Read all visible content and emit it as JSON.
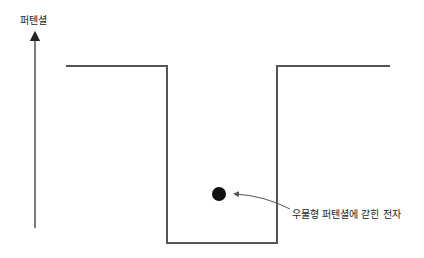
{
  "diagram": {
    "axis_label": "퍼텐셜",
    "annotation": "우물형 퍼텐셜에 갇힌 전자",
    "colors": {
      "line": "#555555",
      "particle": "#111111",
      "text": "#222222"
    },
    "well": {
      "left_plateau": [
        [
          66,
          66
        ],
        [
          167,
          66
        ]
      ],
      "left_wall": [
        [
          167,
          66
        ],
        [
          167,
          243
        ]
      ],
      "bottom": [
        [
          167,
          243
        ],
        [
          277,
          243
        ]
      ],
      "right_wall": [
        [
          277,
          243
        ],
        [
          277,
          66
        ]
      ],
      "right_plateau": [
        [
          277,
          66
        ],
        [
          390,
          66
        ]
      ]
    },
    "particle": {
      "cx": 219,
      "cy": 194,
      "r": 7
    }
  }
}
